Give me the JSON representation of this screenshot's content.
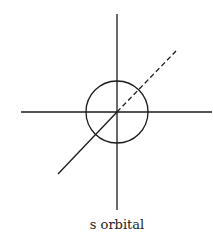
{
  "diagram": {
    "title": "s orbital",
    "stroke_color": "#1a1a1a",
    "axes": {
      "z_axis": {
        "x1": 117,
        "y1": 14,
        "x2": 117,
        "y2": 210
      },
      "x_axis": {
        "x1": 21,
        "y1": 112,
        "x2": 212,
        "y2": 112
      },
      "y_axis_solid": {
        "x1": 58,
        "y1": 174,
        "x2": 117,
        "y2": 112
      },
      "y_axis_dashed": {
        "x1": 117,
        "y1": 112,
        "x2": 176,
        "y2": 51
      }
    },
    "orbital": {
      "shape": "circle",
      "cx": 117,
      "cy": 112,
      "r": 31
    }
  }
}
